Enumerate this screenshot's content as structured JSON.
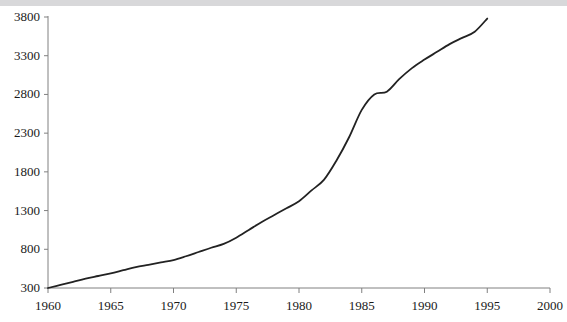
{
  "chart_data": {
    "type": "line",
    "title": "",
    "subtitle": "",
    "xlabel": "",
    "ylabel": "",
    "xlim": [
      1960,
      2000
    ],
    "ylim": [
      300,
      3800
    ],
    "grid": false,
    "legend": null,
    "legend_position": "none",
    "line_color": "#222222",
    "line_width": 1.8,
    "axis_color": "#808080",
    "background": "#ffffff",
    "xticks": [
      1960,
      1965,
      1970,
      1975,
      1980,
      1985,
      1990,
      1995,
      2000
    ],
    "xtick_labels": [
      "1960",
      "1965",
      "1970",
      "1975",
      "1980",
      "1985",
      "1990",
      "1995",
      "2000"
    ],
    "yticks": [
      300,
      800,
      1300,
      1800,
      2300,
      2800,
      3300,
      3800
    ],
    "ytick_labels": [
      "300",
      "800",
      "1300",
      "1800",
      "2300",
      "2800",
      "3300",
      "3800"
    ],
    "series": [
      {
        "name": "series-1",
        "x": [
          1960,
          1961,
          1962,
          1963,
          1964,
          1965,
          1966,
          1967,
          1968,
          1969,
          1970,
          1971,
          1972,
          1973,
          1974,
          1975,
          1976,
          1977,
          1978,
          1979,
          1980,
          1981,
          1982,
          1983,
          1984,
          1985,
          1986,
          1987,
          1988,
          1989,
          1990,
          1991,
          1992,
          1993,
          1994,
          1995
        ],
        "values": [
          300,
          340,
          380,
          420,
          455,
          490,
          530,
          570,
          600,
          630,
          660,
          710,
          765,
          820,
          870,
          950,
          1050,
          1150,
          1240,
          1330,
          1420,
          1560,
          1700,
          1950,
          2250,
          2600,
          2800,
          2835,
          3000,
          3140,
          3250,
          3350,
          3450,
          3530,
          3610,
          3780
        ]
      }
    ]
  },
  "axis": {
    "y_tick_mark": "-",
    "x_tick_mark": "|"
  }
}
